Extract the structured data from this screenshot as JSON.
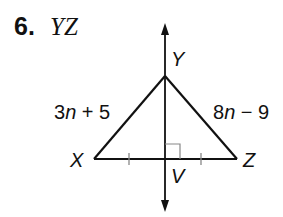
{
  "problem": {
    "number": "6.",
    "segment": "YZ"
  },
  "diagram": {
    "points": {
      "X": {
        "label": "X",
        "x": 94,
        "y": 159
      },
      "Y": {
        "label": "Y",
        "x": 165,
        "y": 76
      },
      "Z": {
        "label": "Z",
        "x": 237,
        "y": 159
      },
      "V": {
        "label": "V",
        "x": 165,
        "y": 159
      }
    },
    "side_labels": {
      "XY": {
        "coef": "3",
        "var": "n",
        "rest": " + 5"
      },
      "YZ": {
        "coef": "8",
        "var": "n",
        "rest": " − 9"
      }
    },
    "markings": [
      "right-angle at V",
      "congruent tick marks on XV and VZ",
      "perpendicular bisector line through Y and V with arrows"
    ],
    "line_color": "#111111"
  }
}
